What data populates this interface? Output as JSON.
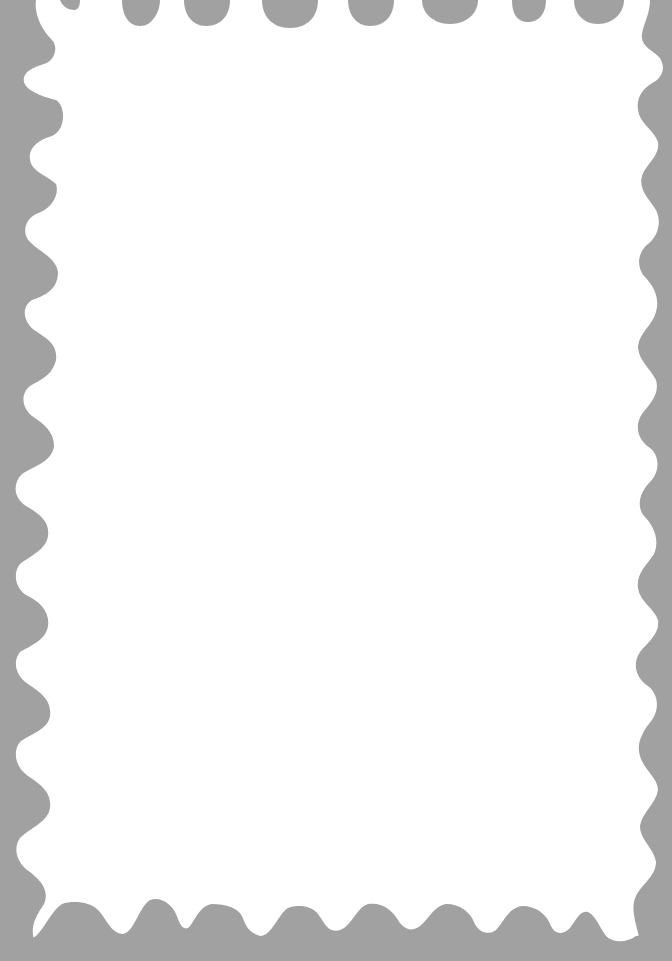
{
  "frame": {
    "shape": "postage-stamp",
    "border_color": "#a1a1a1",
    "inner_color": "#ffffff",
    "content": ""
  }
}
